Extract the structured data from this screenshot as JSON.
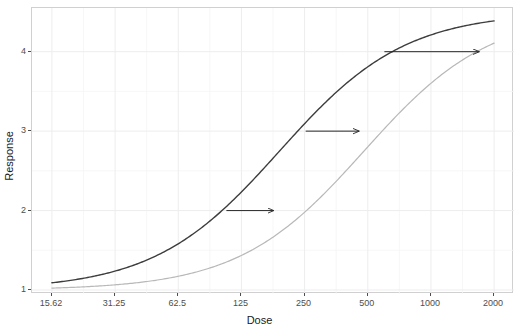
{
  "chart_data": {
    "type": "line",
    "title": "",
    "xlabel": "Dose",
    "ylabel": "Response",
    "xscale": "log2",
    "xlim": [
      15.62,
      2000
    ],
    "ylim": [
      0.95,
      4.55
    ],
    "grid": true,
    "legend": "none",
    "x_ticks": [
      "15.62",
      "31.25",
      "62.5",
      "125",
      "250",
      "500",
      "1000",
      "2000"
    ],
    "x_tick_values": [
      15.62,
      31.25,
      62.5,
      125,
      250,
      500,
      1000,
      2000
    ],
    "y_ticks": [
      "1",
      "2",
      "3",
      "4"
    ],
    "y_tick_values": [
      1,
      2,
      3,
      4
    ],
    "y_minor_values": [
      1.5,
      2.5,
      3.5
    ],
    "series": [
      {
        "name": "reference-curve",
        "color": "#3d3d3d",
        "width": 1.4,
        "model": "four-parameter-logistic",
        "bottom": 1.0,
        "top": 4.5,
        "ec50": 190,
        "hill": 1.45,
        "x": [
          15.62,
          22.1,
          31.25,
          44.2,
          62.5,
          88.4,
          125,
          176.8,
          250,
          353.6,
          500,
          707.1,
          1000,
          1414.2,
          2000
        ],
        "y": [
          1.07,
          1.12,
          1.2,
          1.33,
          1.51,
          1.78,
          2.12,
          2.55,
          3.0,
          3.43,
          3.79,
          4.05,
          4.22,
          4.33,
          4.4
        ]
      },
      {
        "name": "shifted-curve",
        "color": "#b8b8b8",
        "width": 1.2,
        "model": "four-parameter-logistic",
        "bottom": 1.0,
        "top": 4.5,
        "ec50": 480,
        "hill": 1.45,
        "x": [
          15.62,
          22.1,
          31.25,
          44.2,
          62.5,
          88.4,
          125,
          176.8,
          250,
          353.6,
          500,
          707.1,
          1000,
          1414.2,
          2000
        ],
        "y": [
          1.03,
          1.05,
          1.09,
          1.14,
          1.23,
          1.36,
          1.55,
          1.81,
          2.14,
          2.52,
          2.93,
          3.31,
          3.65,
          3.91,
          4.1
        ]
      }
    ],
    "annotations": [
      {
        "name": "shift-arrow-response-2",
        "type": "arrow",
        "y": 2.0,
        "x_start": 106,
        "x_end": 178,
        "color": "#262626"
      },
      {
        "name": "shift-arrow-response-3",
        "type": "arrow",
        "y": 3.0,
        "x_start": 253,
        "x_end": 455,
        "color": "#262626"
      },
      {
        "name": "shift-arrow-response-4",
        "type": "arrow",
        "y": 4.0,
        "x_start": 600,
        "x_end": 1700,
        "color": "#262626"
      }
    ]
  },
  "axes": {
    "x_title": "Dose",
    "y_title": "Response"
  },
  "colors": {
    "panel_background": "#ffffff",
    "major_grid": "#ededed",
    "minor_grid": "#f5f5f5",
    "panel_border": "#d0d0d0",
    "tick_text": "#4d4d4d",
    "axis_title": "#1a1a1a",
    "curve_dark": "#3d3d3d",
    "curve_light": "#b8b8b8",
    "arrow": "#262626"
  }
}
